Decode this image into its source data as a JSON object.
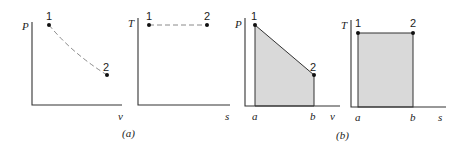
{
  "panels": [
    {
      "id": "a-pv",
      "y_label": "P",
      "x_label": "v",
      "points": [
        {
          "label": "1"
        },
        {
          "label": "2"
        }
      ],
      "path": "dashed curve"
    },
    {
      "id": "a-ts",
      "y_label": "T",
      "x_label": "s",
      "points": [
        {
          "label": "1"
        },
        {
          "label": "2"
        }
      ],
      "path": "dashed horizontal line"
    },
    {
      "id": "b-pv",
      "y_label": "P",
      "x_label": "v",
      "points": [
        {
          "label": "1"
        },
        {
          "label": "2"
        }
      ],
      "x_marks": [
        "a",
        "b"
      ],
      "shaded": true
    },
    {
      "id": "b-ts",
      "y_label": "T",
      "x_label": "s",
      "points": [
        {
          "label": "1"
        },
        {
          "label": "2"
        }
      ],
      "x_marks": [
        "a",
        "b"
      ],
      "shaded": true
    }
  ],
  "captions": {
    "a": "(a)",
    "b": "(b)"
  },
  "colors": {
    "axis": "#333333",
    "shade": "#d9d9d9",
    "dash": "#8a8a8a"
  }
}
